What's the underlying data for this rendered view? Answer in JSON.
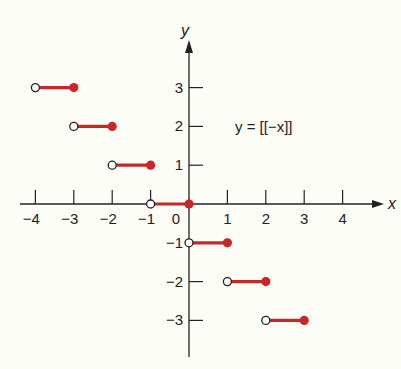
{
  "chart_data": {
    "type": "line",
    "title": "",
    "annotation": "y = [[−x]]",
    "xlabel": "x",
    "ylabel": "y",
    "xlim": [
      -4.5,
      5
    ],
    "ylim": [
      -4,
      4
    ],
    "grid": false,
    "x_ticks": [
      -4,
      -3,
      -2,
      -1,
      0,
      1,
      2,
      3,
      4
    ],
    "y_ticks": [
      -3,
      -2,
      -1,
      1,
      2,
      3
    ],
    "x_tick_labels": [
      "−4",
      "−3",
      "−2",
      "−1",
      "0",
      "1",
      "2",
      "3",
      "4"
    ],
    "y_tick_labels": [
      "−3",
      "−2",
      "−1",
      "1",
      "2",
      "3"
    ],
    "series": [
      {
        "name": "y = [[−x]]",
        "color": "#c62828",
        "segments": [
          {
            "x_start": -4,
            "x_end": -3,
            "y": 3,
            "start_open": true,
            "end_closed": true
          },
          {
            "x_start": -3,
            "x_end": -2,
            "y": 2,
            "start_open": true,
            "end_closed": true
          },
          {
            "x_start": -2,
            "x_end": -1,
            "y": 1,
            "start_open": true,
            "end_closed": true
          },
          {
            "x_start": -1,
            "x_end": 0,
            "y": 0,
            "start_open": true,
            "end_closed": true
          },
          {
            "x_start": 0,
            "x_end": 1,
            "y": -1,
            "start_open": true,
            "end_closed": true
          },
          {
            "x_start": 1,
            "x_end": 2,
            "y": -2,
            "start_open": true,
            "end_closed": true
          },
          {
            "x_start": 2,
            "x_end": 3,
            "y": -3,
            "start_open": true,
            "end_closed": true
          }
        ]
      }
    ]
  },
  "labels": {
    "x_axis": "x",
    "y_axis": "y",
    "equation": "y = [[−x]]"
  },
  "colors": {
    "step": "#c62828",
    "axis": "#222222",
    "background": "#fdfdf7"
  }
}
